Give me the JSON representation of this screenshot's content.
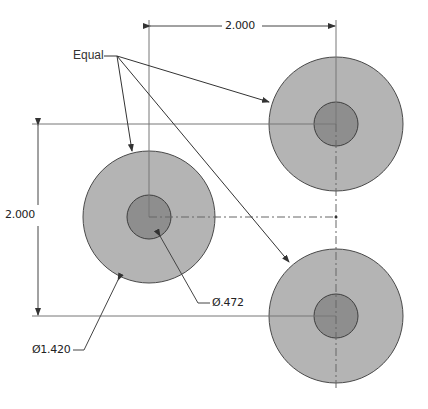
{
  "drawing": {
    "note_label": "Equal",
    "dimensions": {
      "horizontal": "2.000",
      "vertical": "2.000",
      "outer_diameter": "Ø1.420",
      "inner_diameter": "Ø.472"
    },
    "holes": [
      {
        "name": "left",
        "cx": 149,
        "cy": 217
      },
      {
        "name": "top-right",
        "cx": 336,
        "cy": 124
      },
      {
        "name": "bottom-right",
        "cx": 336,
        "cy": 316
      }
    ],
    "colors": {
      "outer_fill": "#b4b4b4",
      "inner_fill": "#8e8e8e",
      "outline": "#4a4a4a",
      "line": "#555555"
    }
  }
}
